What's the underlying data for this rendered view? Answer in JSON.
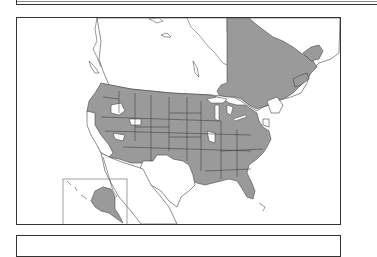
{
  "figure": {
    "type": "range_map",
    "region": "North America",
    "panels": [
      "top-panel",
      "map-frame",
      "bottom-panel"
    ],
    "colors": {
      "range_fill": "#9a9a9a",
      "background": "#ffffff",
      "outline": "#333333"
    },
    "inset": {
      "label": "Alaska inset",
      "shaded": true
    },
    "shaded_regions": [
      "Washington",
      "Oregon",
      "Idaho",
      "Montana",
      "Wyoming",
      "Nevada",
      "Utah",
      "Colorado",
      "Arizona",
      "New Mexico",
      "North Dakota",
      "South Dakota",
      "Nebraska",
      "Kansas",
      "Oklahoma",
      "Minnesota",
      "Iowa",
      "Missouri",
      "Arkansas",
      "Louisiana",
      "Wisconsin",
      "Illinois",
      "Michigan",
      "Indiana",
      "Ohio",
      "Kentucky",
      "Tennessee",
      "Mississippi",
      "Alabama",
      "Georgia",
      "Florida",
      "South Carolina",
      "North Carolina",
      "Virginia",
      "West Virginia",
      "Pennsylvania",
      "New York",
      "Maryland",
      "Quebec",
      "New Brunswick",
      "Nova Scotia",
      "Newfoundland and Labrador",
      "Alaska"
    ],
    "unshaded_regions": [
      "California",
      "Texas",
      "British Columbia",
      "Alberta",
      "Saskatchewan",
      "Manitoba",
      "Ontario (north)",
      "Northwest Territories",
      "Nunavut",
      "Yukon",
      "Mexico",
      "New England (part)",
      "New Jersey"
    ]
  }
}
